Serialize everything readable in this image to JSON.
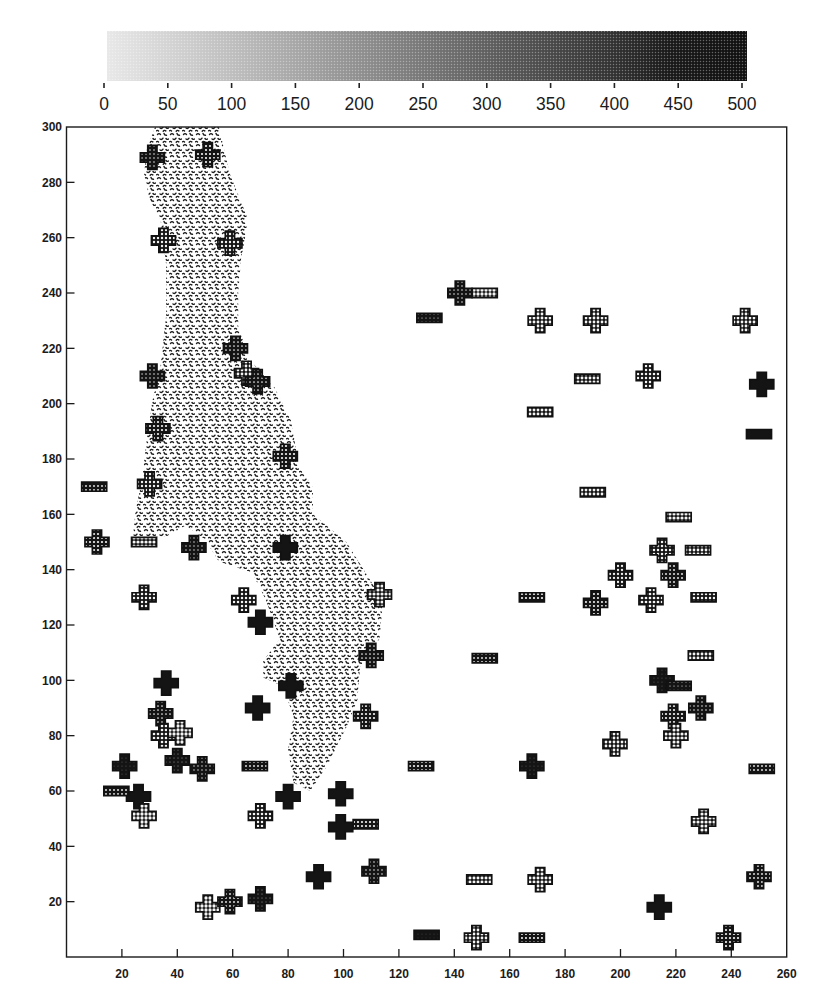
{
  "chart_data": {
    "type": "scatter",
    "title": "",
    "xlabel": "",
    "ylabel": "",
    "xlim": [
      0,
      260
    ],
    "ylim": [
      0,
      300
    ],
    "grid": false,
    "x_ticks": [
      20,
      40,
      60,
      80,
      100,
      120,
      140,
      160,
      180,
      200,
      220,
      240,
      260
    ],
    "y_ticks": [
      20,
      40,
      60,
      80,
      100,
      120,
      140,
      160,
      180,
      200,
      220,
      240,
      260,
      280,
      300
    ],
    "colorbar": {
      "position": "top",
      "orientation": "horizontal",
      "colormap": "grayscale halftone, light (0) to black (500)",
      "min": 0,
      "max": 500,
      "ticks": [
        0,
        50,
        100,
        150,
        200,
        250,
        300,
        350,
        400,
        450,
        500
      ]
    },
    "point_format": [
      "x",
      "y",
      "value"
    ],
    "series": [
      {
        "name": "cross markers",
        "marker": "cross",
        "points": [
          [
            31,
            289,
            400
          ],
          [
            51,
            290,
            340
          ],
          [
            35,
            259,
            310
          ],
          [
            59,
            258,
            310
          ],
          [
            61,
            220,
            390
          ],
          [
            31,
            210,
            410
          ],
          [
            65,
            211,
            260
          ],
          [
            69,
            208,
            390
          ],
          [
            33,
            191,
            330
          ],
          [
            79,
            181,
            330
          ],
          [
            30,
            171,
            310
          ],
          [
            11,
            150,
            330
          ],
          [
            46,
            148,
            420
          ],
          [
            79,
            148,
            480
          ],
          [
            28,
            130,
            300
          ],
          [
            64,
            129,
            300
          ],
          [
            70,
            121,
            490
          ],
          [
            113,
            131,
            210
          ],
          [
            110,
            109,
            390
          ],
          [
            36,
            99,
            490
          ],
          [
            81,
            98,
            490
          ],
          [
            34,
            88,
            390
          ],
          [
            69,
            90,
            490
          ],
          [
            35,
            80,
            280
          ],
          [
            41,
            81,
            180
          ],
          [
            108,
            87,
            330
          ],
          [
            21,
            69,
            450
          ],
          [
            40,
            71,
            440
          ],
          [
            49,
            68,
            420
          ],
          [
            26,
            58,
            480
          ],
          [
            28,
            51,
            180
          ],
          [
            70,
            51,
            290
          ],
          [
            80,
            58,
            490
          ],
          [
            99,
            59,
            490
          ],
          [
            99,
            47,
            490
          ],
          [
            168,
            69,
            450
          ],
          [
            91,
            29,
            490
          ],
          [
            111,
            31,
            400
          ],
          [
            171,
            28,
            230
          ],
          [
            51,
            18,
            180
          ],
          [
            59,
            20,
            380
          ],
          [
            70,
            21,
            440
          ],
          [
            148,
            7,
            260
          ],
          [
            214,
            18,
            480
          ],
          [
            239,
            7,
            330
          ],
          [
            250,
            29,
            380
          ],
          [
            230,
            49,
            200
          ],
          [
            198,
            77,
            260
          ],
          [
            219,
            87,
            330
          ],
          [
            220,
            80,
            200
          ],
          [
            229,
            90,
            400
          ],
          [
            215,
            100,
            450
          ],
          [
            191,
            128,
            350
          ],
          [
            211,
            129,
            270
          ],
          [
            200,
            138,
            320
          ],
          [
            219,
            138,
            370
          ],
          [
            215,
            147,
            300
          ],
          [
            142,
            240,
            400
          ],
          [
            171,
            230,
            250
          ],
          [
            191,
            230,
            260
          ],
          [
            245,
            230,
            260
          ],
          [
            210,
            210,
            300
          ],
          [
            251,
            207,
            480
          ]
        ]
      },
      {
        "name": "rectangle markers",
        "marker": "rect",
        "points": [
          [
            10,
            170,
            380
          ],
          [
            28,
            150,
            190
          ],
          [
            68,
            69,
            380
          ],
          [
            18,
            60,
            370
          ],
          [
            108,
            48,
            330
          ],
          [
            128,
            69,
            330
          ],
          [
            149,
            28,
            230
          ],
          [
            130,
            8,
            470
          ],
          [
            168,
            7,
            350
          ],
          [
            251,
            68,
            380
          ],
          [
            221,
            98,
            430
          ],
          [
            229,
            109,
            250
          ],
          [
            151,
            108,
            380
          ],
          [
            168,
            130,
            330
          ],
          [
            230,
            130,
            300
          ],
          [
            228,
            147,
            260
          ],
          [
            221,
            159,
            200
          ],
          [
            190,
            168,
            260
          ],
          [
            151,
            240,
            180
          ],
          [
            131,
            231,
            430
          ],
          [
            188,
            209,
            240
          ],
          [
            171,
            197,
            250
          ],
          [
            250,
            189,
            490
          ]
        ]
      }
    ],
    "regions": [
      {
        "name": "stippled region",
        "pattern": "stipple",
        "polygon": [
          [
            32,
            300
          ],
          [
            55,
            300
          ],
          [
            59,
            283
          ],
          [
            65,
            268
          ],
          [
            65,
            263
          ],
          [
            63,
            252
          ],
          [
            62,
            240
          ],
          [
            62,
            228
          ],
          [
            66,
            216
          ],
          [
            75,
            206
          ],
          [
            81,
            194
          ],
          [
            84,
            177
          ],
          [
            89,
            170
          ],
          [
            89,
            160
          ],
          [
            101,
            150
          ],
          [
            111,
            134
          ],
          [
            114,
            126
          ],
          [
            113,
            115
          ],
          [
            106,
            105
          ],
          [
            105,
            93
          ],
          [
            101,
            83
          ],
          [
            94,
            69
          ],
          [
            88,
            60
          ],
          [
            82,
            63
          ],
          [
            80,
            75
          ],
          [
            82,
            87
          ],
          [
            78,
            98
          ],
          [
            71,
            101
          ],
          [
            71,
            107
          ],
          [
            77,
            115
          ],
          [
            72,
            129
          ],
          [
            67,
            139
          ],
          [
            55,
            143
          ],
          [
            50,
            151
          ],
          [
            43,
            156
          ],
          [
            36,
            152
          ],
          [
            24,
            152
          ],
          [
            25,
            162
          ],
          [
            27,
            171
          ],
          [
            29,
            187
          ],
          [
            31,
            201
          ],
          [
            34,
            214
          ],
          [
            36,
            232
          ],
          [
            36,
            250
          ],
          [
            34,
            266
          ],
          [
            30,
            274
          ],
          [
            28,
            283
          ],
          [
            29,
            292
          ]
        ]
      }
    ]
  }
}
